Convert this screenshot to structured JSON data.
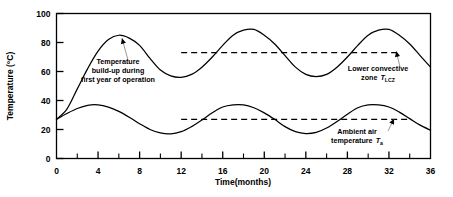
{
  "chart_data": {
    "type": "line",
    "title": "",
    "xlabel": "Time(months)",
    "ylabel": "Temperature (°C)",
    "xlim": [
      0,
      36
    ],
    "ylim": [
      0,
      100
    ],
    "grid": false,
    "legend_position": "none",
    "x_ticks_major": [
      0,
      4,
      8,
      12,
      16,
      20,
      24,
      28,
      32,
      36
    ],
    "x_tick_labels": [
      "0",
      "4",
      "8",
      "12",
      "16",
      "20",
      "24",
      "28",
      "32",
      "36"
    ],
    "x_ticks_minor": [
      2,
      6,
      10,
      14,
      18,
      22,
      26,
      30,
      34
    ],
    "y_ticks_major": [
      0,
      20,
      40,
      60,
      80,
      100
    ],
    "y_tick_labels": [
      "0",
      "20",
      "40",
      "60",
      "80",
      "100"
    ],
    "series": [
      {
        "name": "Lower convective zone temperature",
        "symbol": "T_LCZ",
        "style": "solid",
        "color": "#000000",
        "x": [
          0,
          1,
          2,
          3,
          4,
          5,
          6,
          7,
          8,
          9,
          10,
          11,
          12,
          13,
          14,
          15,
          16,
          17,
          18,
          19,
          20,
          21,
          22,
          23,
          24,
          25,
          26,
          27,
          28,
          29,
          30,
          31,
          32,
          33,
          34,
          35,
          36
        ],
        "values": [
          27,
          34,
          48,
          62,
          74,
          82,
          85,
          83,
          78,
          69,
          61,
          57,
          56,
          58,
          63,
          70,
          78,
          85,
          88.5,
          89,
          85,
          79,
          71,
          63,
          58,
          56.5,
          58,
          63,
          70,
          78,
          85,
          88.5,
          89,
          85,
          79,
          71,
          63
        ]
      },
      {
        "name": "Ambient air temperature",
        "symbol": "T_a",
        "style": "solid",
        "color": "#000000",
        "x": [
          0,
          1,
          2,
          3,
          4,
          5,
          6,
          7,
          8,
          9,
          10,
          11,
          12,
          13,
          14,
          15,
          16,
          17,
          18,
          19,
          20,
          21,
          22,
          23,
          24,
          25,
          26,
          27,
          28,
          29,
          30,
          31,
          32,
          33,
          34,
          35,
          36
        ],
        "values": [
          27,
          31,
          34.5,
          36.7,
          37,
          35.5,
          32.5,
          28.5,
          24,
          20,
          17.6,
          17,
          18.5,
          22,
          26.5,
          31.5,
          35.5,
          37,
          37,
          35,
          31.5,
          27,
          22,
          18.5,
          17.2,
          18,
          21,
          25.5,
          30.5,
          35,
          37,
          37,
          35.5,
          32,
          27.5,
          23,
          19.5
        ]
      }
    ],
    "reference_lines": [
      {
        "name": "lcz-mean-line",
        "label": "T_LCZ mean",
        "y": 73,
        "x_start": 12,
        "x_end": 33,
        "style": "dashed",
        "color": "#000000"
      },
      {
        "name": "ambient-mean-line",
        "label": "T_a mean",
        "y": 27,
        "x_start": 12,
        "x_end": 34,
        "style": "dashed",
        "color": "#000000"
      }
    ],
    "annotations": [
      {
        "name": "buildup-annotation",
        "lines": [
          "Temperature",
          "build-up during",
          "first year of operation"
        ],
        "text": "Temperature build-up during first year of operation",
        "text_x": 7.8,
        "text_y": 62,
        "arrow_to_x": 6.3,
        "arrow_to_y": 83
      },
      {
        "name": "lcz-annotation",
        "lines": [
          "Lower convective",
          "zone"
        ],
        "symbol": "T",
        "subscript": "LCZ",
        "text": "Lower convective zone T_LCZ",
        "text_x": 29.0,
        "text_y": 54,
        "arrow_to_x": 32.7,
        "arrow_to_y": 74
      },
      {
        "name": "ambient-annotation",
        "lines": [
          "Ambient air",
          "temperature"
        ],
        "symbol": "T",
        "subscript": "a",
        "text": "Ambient air temperature T_a",
        "text_x": 26.5,
        "text_y": 15.5,
        "arrow_to_x": 32.5,
        "arrow_to_y": 27.5
      }
    ]
  },
  "colors": {
    "axis": "#000000",
    "curve": "#000000",
    "background": "#ffffff",
    "dashed": "#000000"
  }
}
